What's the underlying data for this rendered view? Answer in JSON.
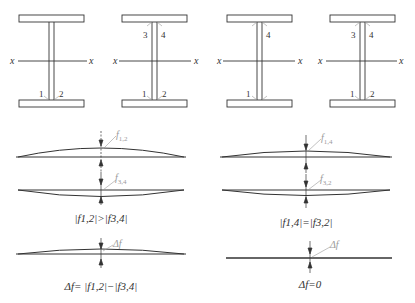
{
  "sections": [
    {
      "id": "beam-a",
      "weld_labels": [
        "1",
        "2"
      ],
      "axis_label_left": "x",
      "axis_label_right": "x"
    },
    {
      "id": "beam-b",
      "weld_labels": [
        "3",
        "4",
        "1",
        "2"
      ],
      "axis_label_left": "x",
      "axis_label_right": "x"
    },
    {
      "id": "beam-c",
      "weld_labels": [
        "4",
        "1"
      ],
      "axis_label_left": "x",
      "axis_label_right": "x"
    },
    {
      "id": "beam-d",
      "weld_labels": [
        "3",
        "4",
        "1",
        "2"
      ],
      "axis_label_left": "x",
      "axis_label_right": "x"
    }
  ],
  "left_case": {
    "deflection_top_label": "f",
    "deflection_top_sub": "1,2",
    "deflection_bottom_label": "f",
    "deflection_bottom_sub": "3,4",
    "comparison": "|f1,2|>|f3,4|",
    "net_label": "Δf",
    "net_formula": "Δf= |f1,2|−|f3,4|"
  },
  "right_case": {
    "deflection_top_label": "f",
    "deflection_top_sub": "1,4",
    "deflection_bottom_label": "f",
    "deflection_bottom_sub": "3,2",
    "comparison": "|f1,4|=|f3,2|",
    "net_label": "Δf",
    "net_formula": "Δf=0"
  }
}
